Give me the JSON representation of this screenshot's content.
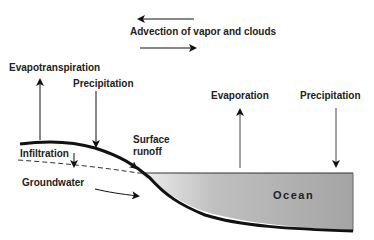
{
  "diagram": {
    "labels": {
      "advection": "Advection of vapor and clouds",
      "evapotranspiration": "Evapotranspiration",
      "precipitation_land": "Precipitation",
      "evaporation": "Evaporation",
      "precipitation_ocean": "Precipitation",
      "surface_runoff_1": "Surface",
      "surface_runoff_2": "runoff",
      "infiltration": "Infiltration",
      "groundwater": "Groundwater",
      "ocean": "Ocean"
    },
    "colors": {
      "ocean_fill_light": "#e8e8e8",
      "ocean_fill_dark": "#a8a8a8",
      "line": "#111111"
    }
  }
}
